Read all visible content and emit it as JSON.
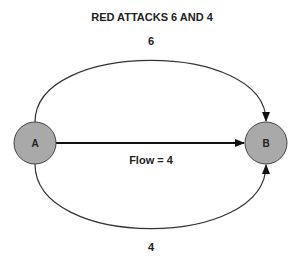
{
  "title": "RED ATTACKS 6 AND 4",
  "nodes": [
    {
      "id": "A",
      "label": "A",
      "cx": 35,
      "cy": 143,
      "r": 21,
      "fill": "#a9a9a9"
    },
    {
      "id": "B",
      "label": "B",
      "cx": 266,
      "cy": 143,
      "r": 21,
      "fill": "#a9a9a9"
    }
  ],
  "edges": [
    {
      "from": "A",
      "to": "B",
      "label": "6",
      "route": "top-arc"
    },
    {
      "from": "A",
      "to": "B",
      "label": "Flow = 4",
      "route": "straight"
    },
    {
      "from": "A",
      "to": "B",
      "label": "4",
      "route": "bottom-arc"
    }
  ],
  "colors": {
    "node_fill": "#a9a9a9",
    "stroke": "#333333",
    "text": "#222222"
  }
}
